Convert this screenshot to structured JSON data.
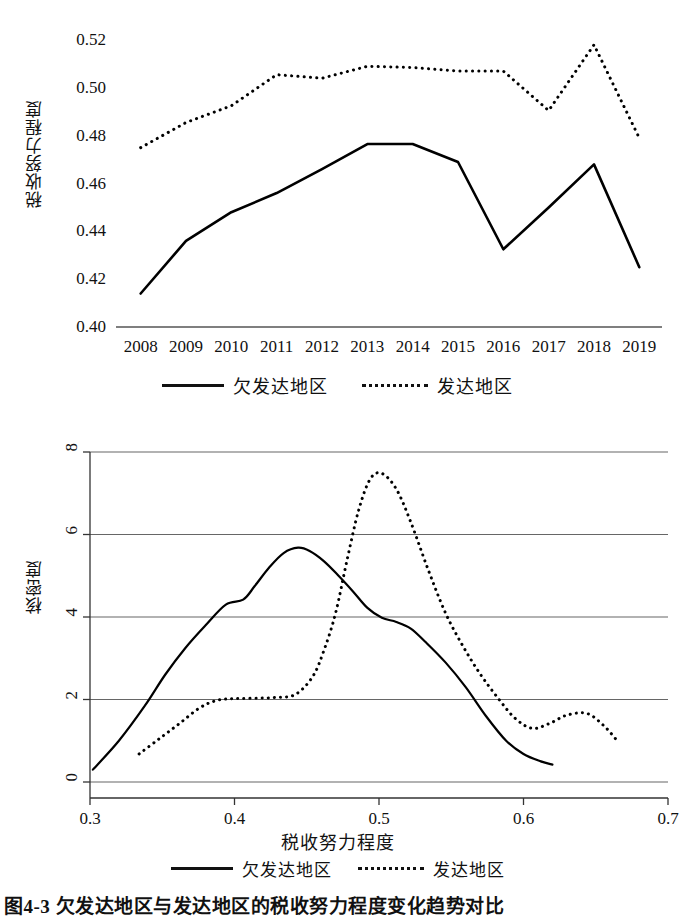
{
  "figure": {
    "caption": "图4-3 欠发达地区与发达地区的税收努力程度变化趋势对比"
  },
  "legend": {
    "series": [
      {
        "label": "欠发达地区",
        "style": "solid"
      },
      {
        "label": "发达地区",
        "style": "dashed"
      }
    ]
  },
  "chart_data": [
    {
      "type": "line",
      "id": "tax-effort-trend",
      "title": "",
      "xlabel": "",
      "ylabel": "税收努力程度",
      "categories": [
        "2008",
        "2009",
        "2010",
        "2011",
        "2012",
        "2013",
        "2014",
        "2015",
        "2016",
        "2017",
        "2018",
        "2019"
      ],
      "ylim": [
        0.4,
        0.52
      ],
      "yticks": [
        "0.40",
        "0.42",
        "0.44",
        "0.46",
        "0.48",
        "0.50",
        "0.52"
      ],
      "ytick_values": [
        0.4,
        0.42,
        0.44,
        0.46,
        0.48,
        0.5,
        0.52
      ],
      "grid": false,
      "legend_position": "bottom",
      "series": [
        {
          "name": "欠发达地区",
          "style": "solid",
          "values": [
            0.414,
            0.436,
            0.448,
            0.456,
            0.466,
            0.4765,
            0.4765,
            0.469,
            0.4325,
            0.45,
            0.468,
            0.425
          ]
        },
        {
          "name": "发达地区",
          "style": "dashed",
          "values": [
            0.475,
            0.4855,
            0.4925,
            0.5055,
            0.504,
            0.509,
            0.5085,
            0.507,
            0.507,
            0.4905,
            0.518,
            0.479
          ]
        }
      ]
    },
    {
      "type": "line",
      "id": "kernel-density",
      "title": "",
      "xlabel": "税收努力程度",
      "ylabel": "核密度",
      "xlim": [
        0.3,
        0.7
      ],
      "ylim": [
        0,
        8
      ],
      "xticks": [
        "0.3",
        "0.4",
        "0.5",
        "0.6",
        "0.7"
      ],
      "xtick_values": [
        0.3,
        0.4,
        0.5,
        0.6,
        0.7
      ],
      "yticks": [
        "0",
        "2",
        "4",
        "6",
        "8"
      ],
      "ytick_values": [
        0,
        2,
        4,
        6,
        8
      ],
      "grid": true,
      "legend_position": "bottom",
      "series": [
        {
          "name": "欠发达地区",
          "style": "solid",
          "x": [
            0.302,
            0.32,
            0.338,
            0.352,
            0.366,
            0.38,
            0.394,
            0.406,
            0.414,
            0.424,
            0.434,
            0.444,
            0.452,
            0.462,
            0.472,
            0.482,
            0.492,
            0.502,
            0.512,
            0.522,
            0.532,
            0.546,
            0.56,
            0.574,
            0.588,
            0.6,
            0.612,
            0.62
          ],
          "values": [
            0.3,
            1.0,
            1.85,
            2.6,
            3.25,
            3.8,
            4.3,
            4.42,
            4.75,
            5.2,
            5.55,
            5.68,
            5.6,
            5.35,
            5.0,
            4.62,
            4.22,
            3.98,
            3.88,
            3.72,
            3.4,
            2.9,
            2.3,
            1.6,
            1.0,
            0.68,
            0.5,
            0.42
          ]
        },
        {
          "name": "发达地区",
          "style": "dashed",
          "x": [
            0.334,
            0.348,
            0.362,
            0.376,
            0.388,
            0.4,
            0.414,
            0.428,
            0.442,
            0.454,
            0.462,
            0.47,
            0.478,
            0.486,
            0.494,
            0.502,
            0.512,
            0.522,
            0.534,
            0.546,
            0.558,
            0.57,
            0.582,
            0.594,
            0.606,
            0.618,
            0.63,
            0.644,
            0.656,
            0.666
          ],
          "values": [
            0.68,
            1.05,
            1.42,
            1.8,
            1.98,
            2.02,
            2.03,
            2.05,
            2.12,
            2.55,
            3.2,
            4.1,
            5.4,
            6.6,
            7.35,
            7.48,
            7.1,
            6.3,
            5.15,
            4.1,
            3.3,
            2.62,
            2.05,
            1.55,
            1.3,
            1.42,
            1.62,
            1.66,
            1.35,
            0.95
          ]
        }
      ]
    }
  ]
}
